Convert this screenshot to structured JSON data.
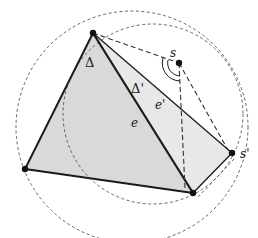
{
  "figure": {
    "colors": {
      "fill_triangle": "#d9d9d9",
      "fill_triangle_prime": "#e8e8e8",
      "stroke": "#1a1a1a",
      "dashed": "#555555",
      "background": "#ffffff"
    },
    "points": {
      "A": {
        "x": 93,
        "y": 33
      },
      "B": {
        "x": 25,
        "y": 169
      },
      "C": {
        "x": 193,
        "y": 193
      },
      "s": {
        "x": 179,
        "y": 63,
        "label": "s"
      },
      "s_prime": {
        "x": 232,
        "y": 153,
        "label": "s'"
      }
    },
    "labels": {
      "delta": "Δ",
      "delta_prime": "Δ'",
      "e": "e",
      "e_prime": "e'",
      "s": "s",
      "s_prime": "s'"
    },
    "circles": [
      {
        "name": "circumcircle-delta",
        "cx": 132,
        "cy": 127,
        "r": 116
      },
      {
        "name": "circumcircle-delta-prime",
        "cx": 153,
        "cy": 114,
        "r": 90
      }
    ]
  }
}
